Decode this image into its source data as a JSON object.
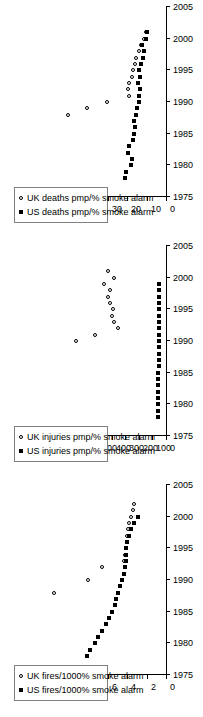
{
  "figure": {
    "orientation": "rotated-90-ccw",
    "panel_count": 3,
    "marker_uk": "open-circle",
    "marker_us": "filled-square",
    "colors": {
      "ink": "#000000",
      "background": "#ffffff",
      "legend_border": "#808080"
    }
  },
  "chart_data": [
    {
      "id": "deaths",
      "type": "scatter",
      "title": "",
      "xlabel": "",
      "ylabel": "",
      "xlim": [
        1975,
        2005
      ],
      "ylim": [
        0,
        70
      ],
      "xticks": [
        1975,
        1980,
        1985,
        1990,
        1995,
        2000,
        2005
      ],
      "yticks": [
        0,
        10,
        20,
        30,
        40,
        50,
        60,
        70
      ],
      "xticklabels": [
        "1975",
        "1980",
        "1985",
        "1990",
        "1995",
        "2000",
        "2005"
      ],
      "yticklabels": [
        "0",
        "10",
        "20",
        "30",
        "40",
        "50",
        "60",
        "70"
      ],
      "grid": false,
      "legend_position": "upper-left",
      "series": [
        {
          "name": "UK deaths pmp/% smoke alarm",
          "marker": "open-circle",
          "x": [
            1988,
            1989,
            1990,
            1991,
            1992,
            1993,
            1994,
            1995,
            1996,
            1997,
            1998,
            1999,
            2000,
            2001
          ],
          "y": [
            50.5,
            40.5,
            30.5,
            19.0,
            19.5,
            19.2,
            17.5,
            17.0,
            16.0,
            15.5,
            14.0,
            13.0,
            11.5,
            10.5
          ]
        },
        {
          "name": "US deaths pmp/% smoke alarm",
          "marker": "filled-square",
          "x": [
            1978,
            1979,
            1980,
            1981,
            1982,
            1983,
            1984,
            1985,
            1986,
            1987,
            1988,
            1989,
            1990,
            1991,
            1992,
            1993,
            1994,
            1995,
            1996,
            1997,
            1998,
            1999,
            2000,
            2001
          ],
          "y": [
            21.0,
            20.5,
            18.0,
            17.5,
            19.5,
            19.0,
            17.0,
            16.5,
            16.0,
            16.5,
            15.5,
            15.0,
            14.0,
            13.8,
            13.2,
            14.5,
            13.5,
            14.0,
            12.8,
            12.0,
            11.5,
            12.5,
            10.5,
            10.0
          ]
        }
      ]
    },
    {
      "id": "injuries",
      "type": "scatter",
      "title": "",
      "xlabel": "",
      "ylabel": "",
      "xlim": [
        1975,
        2005
      ],
      "ylim": [
        0,
        1000
      ],
      "xticks": [
        1975,
        1980,
        1985,
        1990,
        1995,
        2000,
        2005
      ],
      "yticks": [
        0,
        100,
        200,
        300,
        400,
        500,
        600,
        700,
        800,
        900,
        1000
      ],
      "xticklabels": [
        "1975",
        "1980",
        "1985",
        "1990",
        "1995",
        "2000",
        "2005"
      ],
      "yticklabels": [
        "0",
        "100",
        "200",
        "300",
        "400",
        "500",
        "600",
        "700",
        "800",
        "900",
        "1000"
      ],
      "grid": false,
      "legend_position": "upper-left",
      "series": [
        {
          "name": "UK injuries pmp/% smoke alarm",
          "marker": "open-circle",
          "x": [
            1990,
            1991,
            1992,
            1993,
            1994,
            1995,
            1996,
            1997,
            1998,
            1999,
            2000,
            2001
          ],
          "y": [
            660,
            520,
            355,
            380,
            400,
            390,
            415,
            430,
            410,
            455,
            385,
            430
          ]
        },
        {
          "name": "US injuries pmp/% smoke alarm",
          "marker": "filled-square",
          "x": [
            1978,
            1979,
            1980,
            1981,
            1982,
            1983,
            1984,
            1985,
            1986,
            1987,
            1988,
            1989,
            1990,
            1991,
            1992,
            1993,
            1994,
            1995,
            1996,
            1997,
            1998,
            1999
          ],
          "y": [
            60,
            60,
            58,
            58,
            57,
            57,
            56,
            56,
            55,
            55,
            55,
            54,
            54,
            53,
            53,
            52,
            52,
            52,
            51,
            51,
            50,
            50
          ]
        }
      ]
    },
    {
      "id": "fires",
      "type": "scatter",
      "title": "",
      "xlabel": "",
      "ylabel": "",
      "xlim": [
        1975,
        2005
      ],
      "ylim": [
        0,
        14
      ],
      "xticks": [
        1975,
        1980,
        1985,
        1990,
        1995,
        2000,
        2005
      ],
      "yticks": [
        0,
        2,
        4,
        6,
        8,
        10,
        12,
        14
      ],
      "xticklabels": [
        "1975",
        "1980",
        "1985",
        "1990",
        "1995",
        "2000",
        "2005"
      ],
      "yticklabels": [
        "0",
        "2",
        "4",
        "6",
        "8",
        "10",
        "12",
        "14"
      ],
      "grid": false,
      "legend_position": "upper-left",
      "series": [
        {
          "name": "UK fires/1000% smoke alarm",
          "marker": "open-circle",
          "x": [
            1988,
            1990,
            1992,
            1993,
            1994,
            1995,
            1996,
            1997,
            1998,
            1999,
            2000,
            2001,
            2002
          ],
          "y": [
            11.5,
            8.0,
            6.6,
            4.3,
            4.2,
            4.1,
            4.0,
            4.0,
            3.9,
            3.8,
            3.6,
            3.4,
            3.3
          ]
        },
        {
          "name": "US fires/1000% smoke alarm",
          "marker": "filled-square",
          "x": [
            1978,
            1979,
            1980,
            1981,
            1982,
            1983,
            1984,
            1985,
            1986,
            1987,
            1988,
            1989,
            1990,
            1991,
            1992,
            1993,
            1994,
            1995,
            1996,
            1997,
            1998,
            1999,
            2000
          ],
          "y": [
            8.1,
            7.8,
            7.3,
            7.0,
            6.6,
            6.2,
            5.9,
            5.6,
            5.3,
            5.1,
            4.9,
            4.7,
            4.5,
            4.3,
            4.2,
            4.1,
            4.1,
            4.1,
            4.0,
            3.8,
            3.6,
            3.3,
            2.9
          ]
        }
      ]
    }
  ]
}
